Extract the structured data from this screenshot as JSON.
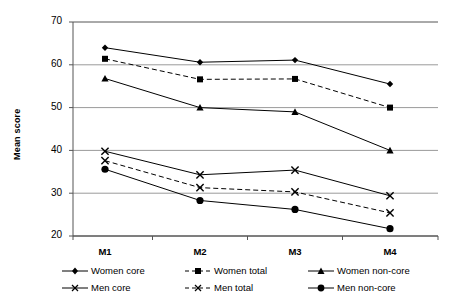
{
  "chart_data": {
    "type": "line",
    "title": "",
    "xlabel": "",
    "ylabel": "Mean score",
    "categories": [
      "M1",
      "M2",
      "M3",
      "M4"
    ],
    "ylim": [
      20,
      70
    ],
    "yticks": [
      20,
      30,
      40,
      50,
      60,
      70
    ],
    "grid": true,
    "legend_position": "bottom",
    "series": [
      {
        "name": "Women core",
        "marker": "diamond",
        "line": "solid",
        "values": [
          64.0,
          60.6,
          61.1,
          55.5
        ]
      },
      {
        "name": "Women total",
        "marker": "square",
        "line": "dashed",
        "values": [
          61.4,
          56.6,
          56.7,
          50.0
        ]
      },
      {
        "name": "Women non-core",
        "marker": "triangle",
        "line": "solid",
        "values": [
          56.8,
          50.0,
          49.0,
          40.0
        ]
      },
      {
        "name": "Men core",
        "marker": "cross",
        "line": "solid",
        "values": [
          39.8,
          34.3,
          35.4,
          29.4
        ]
      },
      {
        "name": "Men total",
        "marker": "cross",
        "line": "dashed",
        "values": [
          37.6,
          31.3,
          30.3,
          25.4
        ]
      },
      {
        "name": "Men non-core",
        "marker": "circle",
        "line": "solid",
        "values": [
          35.6,
          28.3,
          26.2,
          21.7
        ]
      }
    ]
  },
  "axis": {
    "y_label": "Mean score",
    "y_ticks": [
      "70",
      "60",
      "50",
      "40",
      "30",
      "20"
    ],
    "x_ticks": [
      "M1",
      "M2",
      "M3",
      "M4"
    ]
  },
  "legend": {
    "items": [
      {
        "label": "Women core",
        "marker": "diamond-marker",
        "line": "solid-line"
      },
      {
        "label": "Women total",
        "marker": "square-marker",
        "line": "dashed-line"
      },
      {
        "label": "Women non-core",
        "marker": "triangle-marker",
        "line": "solid-line"
      },
      {
        "label": "Men core",
        "marker": "cross-marker",
        "line": "solid-line"
      },
      {
        "label": "Men total",
        "marker": "cross-marker",
        "line": "dashed-line"
      },
      {
        "label": "Men non-core",
        "marker": "circle-marker",
        "line": "solid-line"
      }
    ]
  },
  "colors": {
    "series": "#000000",
    "grid": "#9a9a9a",
    "axis": "#555555",
    "background": "#ffffff"
  }
}
